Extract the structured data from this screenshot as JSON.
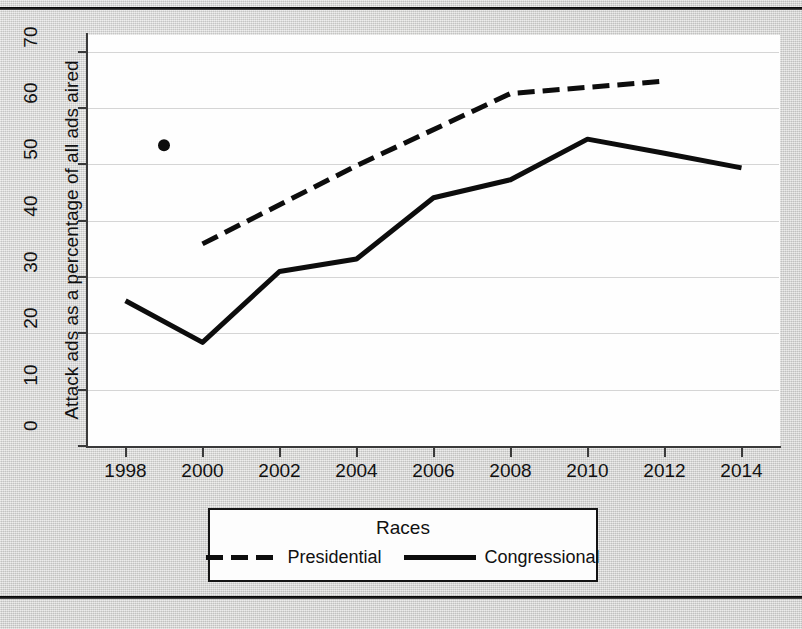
{
  "page": {
    "background_color": "#d7d7d5",
    "top_rule": true,
    "bottom_rule": true,
    "title_fragment": "·                                        ,"
  },
  "chart_data": {
    "type": "line",
    "title": "",
    "xlabel": "",
    "ylabel": "Attack ads as a percentage of all ads aired",
    "xlim": [
      1997,
      2015
    ],
    "ylim": [
      0,
      73
    ],
    "xticks": [
      1998,
      2000,
      2002,
      2004,
      2006,
      2008,
      2010,
      2012,
      2014
    ],
    "yticks": [
      0,
      10,
      20,
      30,
      40,
      50,
      60,
      70
    ],
    "grid": "horizontal",
    "legend": {
      "title": "Races",
      "position": "below-plot",
      "entries": [
        {
          "name": "Presidential",
          "style": "dashed"
        },
        {
          "name": "Congressional",
          "style": "solid"
        }
      ]
    },
    "series": [
      {
        "name": "Presidential",
        "style": "dashed",
        "color": "#0d0d0d",
        "x": [
          2000,
          2004,
          2008,
          2012
        ],
        "values": [
          35.9,
          49.8,
          62.6,
          64.8
        ]
      },
      {
        "name": "Congressional",
        "style": "solid",
        "color": "#0d0d0d",
        "x": [
          1998,
          2000,
          2002,
          2004,
          2006,
          2008,
          2010,
          2012,
          2014
        ],
        "values": [
          25.8,
          18.4,
          31.0,
          33.2,
          44.1,
          47.3,
          54.5,
          52.0,
          49.4
        ]
      }
    ],
    "annotations": [
      {
        "name": "stray-dot",
        "x": 1999,
        "y": 53.4
      }
    ]
  },
  "axis": {
    "y_tick_labels": [
      "0",
      "10",
      "20",
      "30",
      "40",
      "50",
      "60",
      "70"
    ],
    "x_tick_labels": [
      "1998",
      "2000",
      "2002",
      "2004",
      "2006",
      "2008",
      "2010",
      "2012",
      "2014"
    ],
    "y_axis_title": "Attack ads as a percentage of all ads aired"
  },
  "legend": {
    "title": "Races",
    "presidential_label": "Presidential",
    "congressional_label": "Congressional"
  }
}
